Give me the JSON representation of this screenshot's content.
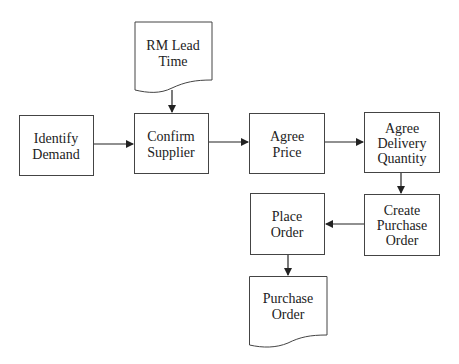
{
  "diagram": {
    "type": "flowchart",
    "colors": {
      "stroke": "#444444",
      "text": "#222222",
      "background": "#ffffff"
    },
    "nodes": {
      "rm_lead_time": {
        "shape": "document",
        "lines": [
          "RM Lead",
          "Time"
        ]
      },
      "identify_demand": {
        "shape": "process",
        "lines": [
          "Identify",
          "Demand"
        ]
      },
      "confirm_supplier": {
        "shape": "process",
        "lines": [
          "Confirm",
          "Supplier"
        ]
      },
      "agree_price": {
        "shape": "process",
        "lines": [
          "Agree",
          "Price"
        ]
      },
      "agree_delivery_quantity": {
        "shape": "process",
        "lines": [
          "Agree",
          "Delivery",
          "Quantity"
        ]
      },
      "create_purchase_order": {
        "shape": "process",
        "lines": [
          "Create",
          "Purchase",
          "Order"
        ]
      },
      "place_order": {
        "shape": "process",
        "lines": [
          "Place",
          "Order"
        ]
      },
      "purchase_order": {
        "shape": "document",
        "lines": [
          "Purchase",
          "Order"
        ]
      }
    },
    "edges": [
      {
        "from": "rm_lead_time",
        "to": "confirm_supplier"
      },
      {
        "from": "identify_demand",
        "to": "confirm_supplier"
      },
      {
        "from": "confirm_supplier",
        "to": "agree_price"
      },
      {
        "from": "agree_price",
        "to": "agree_delivery_quantity"
      },
      {
        "from": "agree_delivery_quantity",
        "to": "create_purchase_order"
      },
      {
        "from": "create_purchase_order",
        "to": "place_order"
      },
      {
        "from": "place_order",
        "to": "purchase_order"
      }
    ]
  }
}
